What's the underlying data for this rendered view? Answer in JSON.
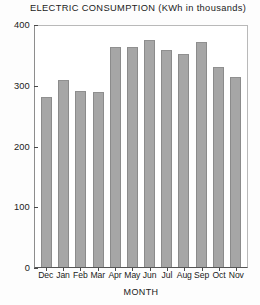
{
  "chart_data": {
    "type": "bar",
    "title": "ELECTRIC CONSUMPTION (KWh in thousands)",
    "xlabel": "MONTH",
    "ylabel": "",
    "categories": [
      "Dec",
      "Jan",
      "Feb",
      "Mar",
      "Apr",
      "May",
      "Jun",
      "Jul",
      "Aug",
      "Sep",
      "Oct",
      "Nov"
    ],
    "values": [
      280,
      308,
      290,
      288,
      362,
      362,
      373,
      358,
      350,
      370,
      330,
      312
    ],
    "ylim": [
      0,
      400
    ],
    "yticks": [
      0,
      100,
      200,
      300,
      400
    ],
    "ytick_labels": [
      "0",
      "100",
      "200",
      "300",
      "400"
    ],
    "grid": false,
    "legend": null,
    "bar_color": "#a6a6a6",
    "bar_edge_color": "#8b8b8b",
    "axis_color": "#4a4a4a",
    "frame_color": "#b9b9b9",
    "background_color": "#ffffff"
  }
}
